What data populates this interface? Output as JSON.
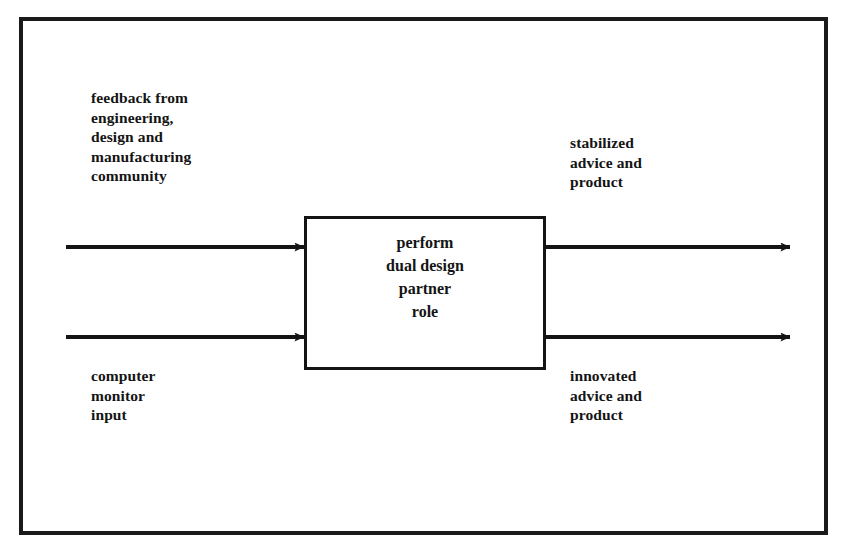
{
  "diagram": {
    "type": "process-flow-block-diagram",
    "background_color": "#ffffff",
    "ink_color": "#141414",
    "frame": {
      "name": "outer-border",
      "x": 19,
      "y": 17,
      "width": 809,
      "height": 518,
      "stroke_width": 4,
      "color": "#1a1a1a"
    },
    "process_box": {
      "name": "dual-design-partner-process",
      "x": 304,
      "y": 216,
      "width": 242,
      "height": 154,
      "stroke_width": 3,
      "color": "#141414",
      "text": "perform\ndual design\npartner\nrole",
      "lines": [
        "perform",
        "dual design",
        "partner",
        "role"
      ]
    },
    "inputs": [
      {
        "name": "feedback-input",
        "label": "feedback from\nengineering,\ndesign and\nmanufacturing\ncommunity",
        "lines": [
          "feedback from",
          "engineering,",
          "design and",
          "manufacturing",
          "community"
        ],
        "arrow": {
          "x1": 66,
          "y1": 247,
          "x2": 304,
          "y2": 247,
          "direction": "right"
        }
      },
      {
        "name": "computer-monitor-input",
        "label": "computer\nmonitor\ninput",
        "lines": [
          "computer",
          "monitor",
          "input"
        ],
        "arrow": {
          "x1": 66,
          "y1": 337,
          "x2": 304,
          "y2": 337,
          "direction": "right"
        }
      }
    ],
    "outputs": [
      {
        "name": "stabilized-output",
        "label": "stabilized\nadvice and\nproduct",
        "lines": [
          "stabilized",
          "advice and",
          "product"
        ],
        "arrow": {
          "x1": 546,
          "y1": 247,
          "x2": 790,
          "y2": 247,
          "direction": "right"
        }
      },
      {
        "name": "innovated-output",
        "label": "innovated\nadvice and\nproduct",
        "lines": [
          "innovated",
          "advice and",
          "product"
        ],
        "arrow": {
          "x1": 546,
          "y1": 337,
          "x2": 790,
          "y2": 337,
          "direction": "right"
        }
      }
    ]
  }
}
